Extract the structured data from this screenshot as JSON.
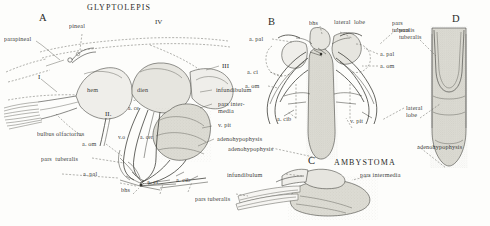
{
  "figure": {
    "caption_title": "GLYPTOLEPIS",
    "second_taxon": "AMBYSTOMA"
  },
  "panels": [
    {
      "letter": "A",
      "taxon": "GLYPTOLEPIS"
    },
    {
      "letter": "B",
      "taxon": ""
    },
    {
      "letter": "C",
      "taxon": "AMBYSTOMA"
    },
    {
      "letter": "D",
      "taxon": ""
    }
  ],
  "panel_a": {
    "letter": "A",
    "title": "GLYPTOLEPIS",
    "labels": {
      "parapineal": "parapineal",
      "pineal": "pineal",
      "hem": "hem",
      "dien": "dien",
      "nerve_i": "I",
      "nerve_ii": "II.",
      "nerve_iii": "III",
      "nerve_iv": "IV",
      "infundibulum": "infundibulum",
      "pars_intermedia_l1": "pars inter-",
      "pars_intermedia_l2": "media",
      "v_pit": "v. pit",
      "adenohypophysis": "adenohypophysis",
      "bulbus_olfactorius": "bulbus olfactorius",
      "a_om": "a. om",
      "pars_tuberalis": "pars  tuberalis",
      "a_pal": "a. pal",
      "bhs": "bhs",
      "a_ci": "a. ci",
      "a_cib": "a. cib",
      "a_cer": "a. cer",
      "v_o": "v.o",
      "a_cer2": "a. ce"
    }
  },
  "panel_b": {
    "letter": "B",
    "labels": {
      "bhs": "bhs",
      "lateral_lobe": "lateral  lobe",
      "pars_tuberalis_l1": "pars",
      "pars_tuberalis_l2": "tuberalis",
      "a_pal_left": "a. pal",
      "a_pal_right": "a. pal",
      "a_om_right": "a. om",
      "a_ci_left": "a. ci",
      "a_om_left": "a. om",
      "a_cib_left": "a. cib",
      "v_pit": "v. pit",
      "adenohypophysis": "adenohypophysis",
      "lateral_lobe_right_l1": "lateral",
      "lateral_lobe_right_l2": "lobe"
    }
  },
  "panel_c": {
    "letter": "C",
    "title": "AMBYSTOMA",
    "labels": {
      "infundibulum": "infundibulum",
      "pars_intermedia": "pars intermedia",
      "pars_tuberalis": "pars tuberalis",
      "adenohypophysis": "adenohypophysis"
    }
  },
  "panel_d": {
    "letter": "D",
    "labels": {
      "pars_tuberalis_l1": "pars",
      "pars_tuberalis_l2": "tuberalis",
      "lateral_lobe_l1": "lateral",
      "lateral_lobe_l2": "lobe",
      "adenohypophysis": "adenohypophysis"
    }
  },
  "colors": {
    "ink": "#3b3b38",
    "tissue_light": "#efeeea",
    "tissue_mid": "#e6e5df",
    "tissue_dark": "#dcdbd3",
    "background": "#fdfdfb"
  }
}
